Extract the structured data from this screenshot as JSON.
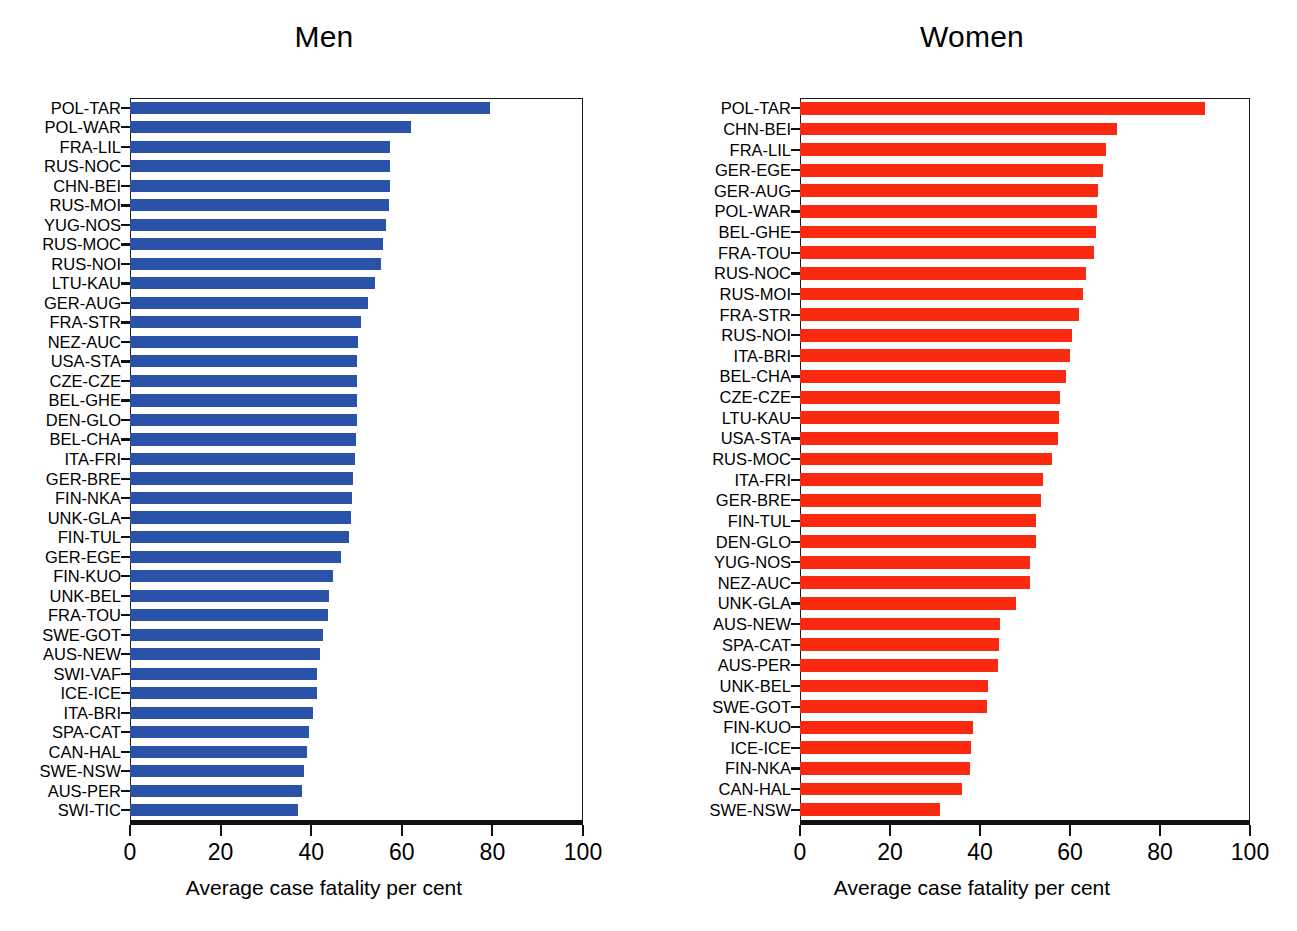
{
  "figure": {
    "cut_off_title": "",
    "axis_label": "Average case fatality per cent",
    "colors": {
      "men": "#2a52a8",
      "women": "#f92a10",
      "axis": "#101010"
    }
  },
  "panels": [
    {
      "title": "Men",
      "series_key": "men"
    },
    {
      "title": "Women",
      "series_key": "women"
    }
  ],
  "chart_data": [
    {
      "type": "bar",
      "orientation": "horizontal",
      "title": "Men",
      "xlabel": "Average case fatality per cent",
      "ylabel": "",
      "xlim": [
        0,
        100
      ],
      "xticks": [
        0,
        20,
        40,
        60,
        80,
        100
      ],
      "grid": false,
      "legend": "none",
      "color": "#2a52a8",
      "categories": [
        "POL-TAR",
        "POL-WAR",
        "FRA-LIL",
        "RUS-NOC",
        "CHN-BEI",
        "RUS-MOI",
        "YUG-NOS",
        "RUS-MOC",
        "RUS-NOI",
        "LTU-KAU",
        "GER-AUG",
        "FRA-STR",
        "NEZ-AUC",
        "USA-STA",
        "CZE-CZE",
        "BEL-GHE",
        "DEN-GLO",
        "BEL-CHA",
        "ITA-FRI",
        "GER-BRE",
        "FIN-NKA",
        "UNK-GLA",
        "FIN-TUL",
        "GER-EGE",
        "FIN-KUO",
        "UNK-BEL",
        "FRA-TOU",
        "SWE-GOT",
        "AUS-NEW",
        "SWI-VAF",
        "ICE-ICE",
        "ITA-BRI",
        "SPA-CAT",
        "CAN-HAL",
        "SWE-NSW",
        "AUS-PER",
        "SWI-TIC"
      ],
      "values": [
        79.5,
        62.0,
        57.5,
        57.5,
        57.3,
        57.2,
        56.5,
        55.8,
        55.3,
        54.0,
        52.5,
        51.0,
        50.3,
        50.2,
        50.1,
        50.0,
        50.0,
        49.8,
        49.7,
        49.3,
        49.0,
        48.8,
        48.4,
        46.5,
        44.8,
        44.0,
        43.8,
        42.5,
        42.0,
        41.3,
        41.2,
        40.5,
        39.5,
        39.0,
        38.5,
        38.0,
        37.0
      ]
    },
    {
      "type": "bar",
      "orientation": "horizontal",
      "title": "Women",
      "xlabel": "Average case fatality per cent",
      "ylabel": "",
      "xlim": [
        0,
        100
      ],
      "xticks": [
        0,
        20,
        40,
        60,
        80,
        100
      ],
      "grid": false,
      "legend": "none",
      "color": "#f92a10",
      "categories": [
        "POL-TAR",
        "CHN-BEI",
        "FRA-LIL",
        "GER-EGE",
        "GER-AUG",
        "POL-WAR",
        "BEL-GHE",
        "FRA-TOU",
        "RUS-NOC",
        "RUS-MOI",
        "FRA-STR",
        "RUS-NOI",
        "ITA-BRI",
        "BEL-CHA",
        "CZE-CZE",
        "LTU-KAU",
        "USA-STA",
        "RUS-MOC",
        "ITA-FRI",
        "GER-BRE",
        "FIN-TUL",
        "DEN-GLO",
        "YUG-NOS",
        "NEZ-AUC",
        "UNK-GLA",
        "AUS-NEW",
        "SPA-CAT",
        "AUS-PER",
        "UNK-BEL",
        "SWE-GOT",
        "FIN-KUO",
        "ICE-ICE",
        "FIN-NKA",
        "CAN-HAL",
        "SWE-NSW"
      ],
      "values": [
        90.0,
        70.5,
        68.0,
        67.3,
        66.3,
        66.0,
        65.7,
        65.3,
        63.5,
        62.8,
        62.0,
        60.5,
        60.0,
        59.0,
        57.8,
        57.5,
        57.3,
        56.0,
        54.0,
        53.5,
        52.5,
        52.5,
        51.0,
        51.0,
        48.0,
        44.5,
        44.3,
        44.0,
        41.8,
        41.5,
        38.5,
        38.0,
        37.8,
        36.0,
        31.0
      ]
    }
  ]
}
